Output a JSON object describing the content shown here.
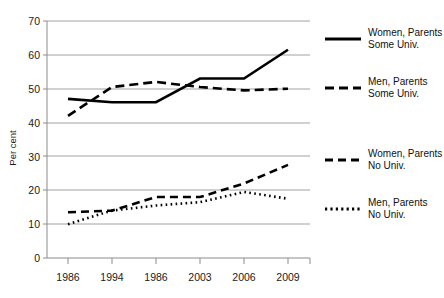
{
  "chart_data": {
    "type": "line",
    "title": "",
    "xlabel": "",
    "ylabel": "Per cent",
    "categories": [
      "1986",
      "1994",
      "1986",
      "2003",
      "2006",
      "2009"
    ],
    "ylim": [
      0,
      70
    ],
    "yticks": [
      0,
      10,
      20,
      30,
      40,
      50,
      60,
      70
    ],
    "ytick_labels": [
      "0",
      "10",
      "20",
      "30",
      "40",
      "50",
      "60",
      "70"
    ],
    "grid": true,
    "legend_position": "right",
    "series": [
      {
        "name": "Women, Parents Some Univ.",
        "line_style": "solid",
        "values": [
          47,
          46,
          46,
          53,
          53,
          61.5
        ]
      },
      {
        "name": "Men, Parents Some Univ.",
        "line_style": "dashed",
        "values": [
          42,
          50.5,
          52,
          50.5,
          49.5,
          50
        ]
      },
      {
        "name": "Women, Parents No Univ.",
        "line_style": "dash-dot",
        "values": [
          13.5,
          14,
          18,
          18,
          22,
          27.5
        ]
      },
      {
        "name": "Men, Parents No Univ.",
        "line_style": "dotted",
        "values": [
          10,
          14,
          15.5,
          16.5,
          19.5,
          17.5
        ]
      }
    ]
  },
  "axis": {
    "y_title": "Per cent",
    "y_labels": [
      "70",
      "60",
      "50",
      "40",
      "30",
      "20",
      "10",
      "0"
    ],
    "x_labels": [
      "1986",
      "1994",
      "1986",
      "2003",
      "2006",
      "2009"
    ]
  },
  "legend": {
    "items": [
      {
        "line1": "Women, Parents",
        "line2": "Some Univ.",
        "style": "solid"
      },
      {
        "line1": "Men, Parents",
        "line2": "Some Univ.",
        "style": "dashed"
      },
      {
        "line1": "Women, Parents",
        "line2": "No Univ.",
        "style": "dash-dot"
      },
      {
        "line1": "Men, Parents",
        "line2": "No Univ.",
        "style": "dotted"
      }
    ]
  },
  "colors": {
    "line": "#000000",
    "grid": "#8c8c8c",
    "text": "#111111",
    "background": "#ffffff"
  }
}
